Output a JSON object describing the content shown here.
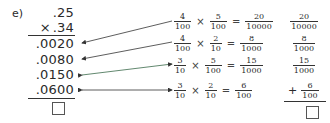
{
  "problem": {
    "label": "e)",
    "multiplicand": ".25",
    "multiplier_sign": "×",
    "multiplier": ".34",
    "partial_products": [
      ".0020",
      ".0080",
      ".0150",
      ".0600"
    ],
    "answer_box": ""
  },
  "expressions": [
    {
      "a_num": "4",
      "a_den": "100",
      "op": "×",
      "b_num": "5",
      "b_den": "100",
      "eq": "=",
      "r_num": "20",
      "r_den": "10000"
    },
    {
      "a_num": "4",
      "a_den": "100",
      "op": "×",
      "b_num": "2",
      "b_den": "10",
      "eq": "=",
      "r_num": "8",
      "r_den": "1000"
    },
    {
      "a_num": "3",
      "a_den": "10",
      "op": "×",
      "b_num": "5",
      "b_den": "100",
      "eq": "=",
      "r_num": "15",
      "r_den": "1000"
    },
    {
      "a_num": "3",
      "a_den": "10",
      "op": "×",
      "b_num": "2",
      "b_den": "10",
      "eq": "=",
      "r_num": "6",
      "r_den": "100"
    }
  ],
  "sum_column": {
    "fractions": [
      {
        "num": "20",
        "den": "10000"
      },
      {
        "num": "8",
        "den": "1000"
      },
      {
        "num": "15",
        "den": "1000"
      },
      {
        "num": "6",
        "den": "100"
      }
    ],
    "plus_sign": "+",
    "answer_box": ""
  },
  "colors": {
    "text": "#2a2a2a",
    "arrow": "#333333",
    "arrow_accent": "#c0304a"
  }
}
